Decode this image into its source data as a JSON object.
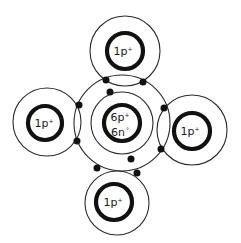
{
  "diagram": {
    "title": "",
    "colors": {
      "line": "#2a2a2a",
      "nucleus": "#111111",
      "electron": "#111111",
      "background": "#ffffff"
    },
    "central_atom": {
      "label_line1": "6p",
      "label_line1_sup": "+",
      "label_line2": "6n",
      "label_line2_sup": "°",
      "center": [
        122,
        123
      ],
      "nucleus_radius": 18,
      "inner_shell_radius": 31,
      "outer_shell_radius": 48
    },
    "hydrogens": [
      {
        "position": "top",
        "label": "1p",
        "sup": "+",
        "center": [
          125,
          51
        ],
        "shell_radius": 35,
        "nucleus_radius": 18
      },
      {
        "position": "left",
        "label": "1p",
        "sup": "+",
        "center": [
          47,
          122
        ],
        "shell_radius": 34,
        "nucleus_radius": 17
      },
      {
        "position": "right",
        "label": "1p",
        "sup": "+",
        "center": [
          192,
          130
        ],
        "shell_radius": 35,
        "nucleus_radius": 18
      },
      {
        "position": "bottom",
        "label": "1p",
        "sup": "+",
        "center": [
          116,
          203
        ],
        "shell_radius": 32,
        "nucleus_radius": 18
      }
    ],
    "inner_electrons": [
      [
        110,
        92
      ],
      [
        131,
        159
      ]
    ],
    "shared_electron_pairs": [
      {
        "bond": "top",
        "electrons": [
          [
            106,
            80
          ],
          [
            143,
            82
          ]
        ]
      },
      {
        "bond": "left",
        "electrons": [
          [
            79,
            105
          ],
          [
            77,
            141
          ]
        ]
      },
      {
        "bond": "right",
        "electrons": [
          [
            164,
            108
          ],
          [
            161,
            149
          ]
        ]
      },
      {
        "bond": "bottom",
        "electrons": [
          [
            97,
            168
          ],
          [
            137,
            173
          ]
        ]
      }
    ]
  }
}
